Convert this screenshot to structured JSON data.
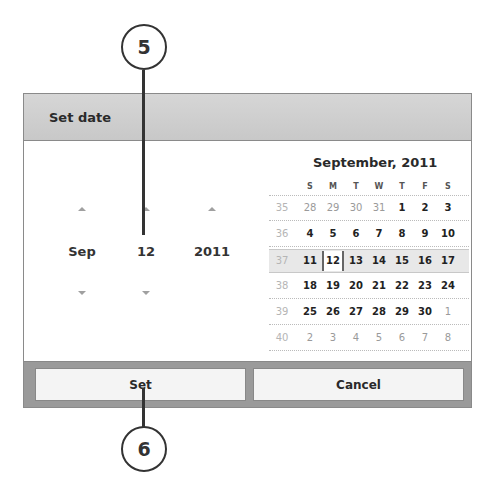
{
  "callouts": [
    {
      "number": "5"
    },
    {
      "number": "6"
    }
  ],
  "dialog": {
    "title": "Set date",
    "spinners": [
      {
        "name": "month",
        "value": "Sep",
        "has_up": true,
        "has_down": true
      },
      {
        "name": "day",
        "value": "12",
        "has_up": true,
        "has_down": true
      },
      {
        "name": "year",
        "value": "2011",
        "has_up": true,
        "has_down": false
      }
    ],
    "calendar": {
      "title": "September, 2011",
      "weekdays": [
        "S",
        "M",
        "T",
        "W",
        "T",
        "F",
        "S"
      ],
      "selected_day": "12",
      "weeks": [
        {
          "week": "35",
          "days": [
            "28",
            "29",
            "30",
            "31",
            "1",
            "2",
            "3"
          ],
          "in_month": [
            false,
            false,
            false,
            false,
            true,
            true,
            true
          ]
        },
        {
          "week": "36",
          "days": [
            "4",
            "5",
            "6",
            "7",
            "8",
            "9",
            "10"
          ],
          "in_month": [
            true,
            true,
            true,
            true,
            true,
            true,
            true
          ]
        },
        {
          "week": "37",
          "days": [
            "11",
            "12",
            "13",
            "14",
            "15",
            "16",
            "17"
          ],
          "in_month": [
            true,
            true,
            true,
            true,
            true,
            true,
            true
          ],
          "current": true
        },
        {
          "week": "38",
          "days": [
            "18",
            "19",
            "20",
            "21",
            "22",
            "23",
            "24"
          ],
          "in_month": [
            true,
            true,
            true,
            true,
            true,
            true,
            true
          ]
        },
        {
          "week": "39",
          "days": [
            "25",
            "26",
            "27",
            "28",
            "29",
            "30",
            "1"
          ],
          "in_month": [
            true,
            true,
            true,
            true,
            true,
            true,
            false
          ]
        },
        {
          "week": "40",
          "days": [
            "2",
            "3",
            "4",
            "5",
            "6",
            "7",
            "8"
          ],
          "in_month": [
            false,
            false,
            false,
            false,
            false,
            false,
            false
          ]
        }
      ]
    },
    "buttons": {
      "set_label": "Set",
      "cancel_label": "Cancel"
    }
  }
}
